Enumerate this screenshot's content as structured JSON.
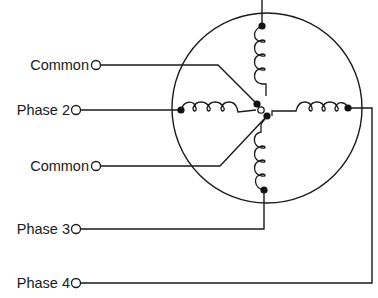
{
  "diagram": {
    "type": "stepper-motor-wiring",
    "labels": {
      "common_top": "Common",
      "phase2": "Phase 2",
      "common_bottom": "Common",
      "phase3": "Phase 3",
      "phase4": "Phase 4"
    },
    "colors": {
      "line": "#1a1a1a",
      "background": "#ffffff"
    }
  }
}
